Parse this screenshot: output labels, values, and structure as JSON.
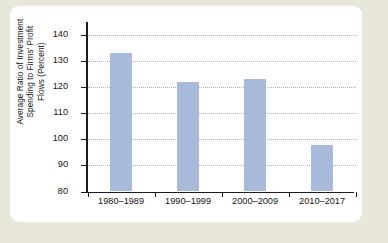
{
  "chart_data": {
    "type": "bar",
    "title": "",
    "subtitle": "",
    "xlabel": "",
    "ylabel_lines": [
      "Average Ratio of Investment",
      "Spending to Firms' Profit",
      "Flows (Percent)"
    ],
    "ylabel": "Average Ratio of Investment Spending to Firms' Profit Flows (Percent)",
    "categories": [
      "1980–1989",
      "1990–1999",
      "2000–2009",
      "2010–2017"
    ],
    "values": [
      133,
      122,
      123,
      98
    ],
    "ylim": [
      80,
      145
    ],
    "yticks": [
      140,
      130,
      120,
      110,
      100,
      90,
      80
    ],
    "ytick_labels": [
      "140",
      "130",
      "120",
      "110",
      "100",
      "90",
      "80"
    ],
    "grid": true,
    "grid_style": "dotted",
    "legend": "none",
    "bar_color": "#a8bada",
    "axis_color": "#1c1c1c",
    "grid_color": "#b4b4b4",
    "background_color": "#ffffff",
    "page_color": "#e9e6da"
  }
}
